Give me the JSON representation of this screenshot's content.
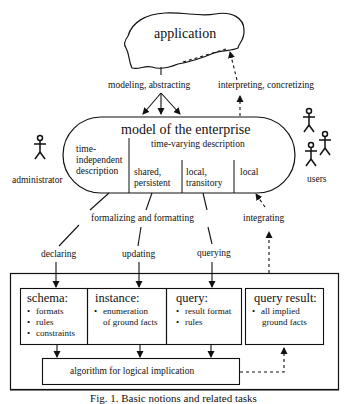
{
  "diagram": {
    "nodes": {
      "application": {
        "label": "application",
        "shape": "cloud"
      },
      "model": {
        "title": "model of the enterprise",
        "shape": "rounded-pill",
        "time_independent": {
          "line1": "time-",
          "line2": "independent",
          "line3": "description"
        },
        "time_varying": {
          "label": "time-varying description",
          "parts": [
            {
              "line1": "shared,",
              "line2": "persistent"
            },
            {
              "line1": "local,",
              "line2": "transitory"
            },
            {
              "line1": "local",
              "line2": ""
            }
          ]
        }
      },
      "schema": {
        "title": "schema:",
        "items": [
          "formats",
          "rules",
          "constraints"
        ]
      },
      "instance": {
        "title": "instance:",
        "items": [
          "enumeration of ground facts"
        ],
        "line1": "enumeration",
        "line2": "of ground facts"
      },
      "query": {
        "title": "query:",
        "items": [
          "result format",
          "rules"
        ]
      },
      "query_result": {
        "title": "query result:",
        "items": [
          "all implied ground facts"
        ],
        "line1": "all implied",
        "line2": "ground facts"
      },
      "algorithm": {
        "label": "algorithm for logical implication"
      }
    },
    "actors": {
      "administrator": {
        "label": "administrator",
        "count": 1
      },
      "users": {
        "label": "users",
        "count": 3
      }
    },
    "edges": {
      "modeling": "modeling, abstracting",
      "interpreting": "interpreting, concretizing",
      "formalizing": "formalizing and formatting",
      "integrating": "integrating",
      "declaring": "declaring",
      "updating": "updating",
      "querying": "querying"
    },
    "caption": "Fig. 1. Basic notions and related tasks"
  }
}
